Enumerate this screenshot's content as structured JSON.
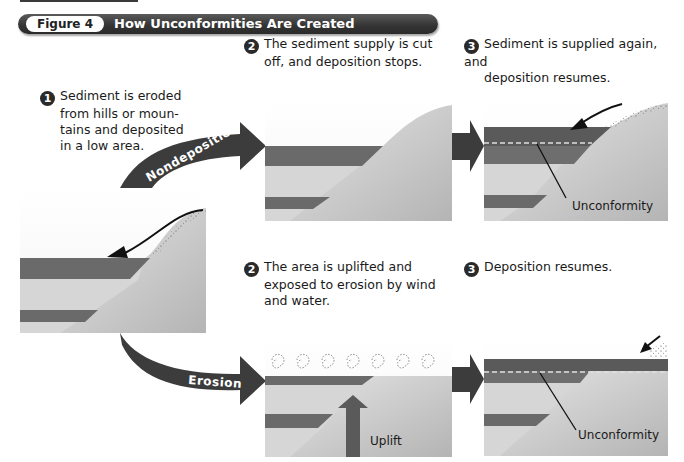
{
  "figure": {
    "label": "Figure 4",
    "title": "How Unconformities Are Created"
  },
  "steps": {
    "step1": {
      "number": "1",
      "text_lines": [
        "Sediment is eroded",
        "from hills or moun-",
        "tains and deposited",
        "in a low area."
      ]
    },
    "top": {
      "step2": {
        "number": "2",
        "text_lines": [
          "The sediment supply is cut",
          "off, and deposition stops."
        ]
      },
      "step3": {
        "number": "3",
        "text_lines": [
          "Sediment is supplied again, and",
          "deposition resumes."
        ]
      }
    },
    "bottom": {
      "step2": {
        "number": "2",
        "text_lines": [
          "The area is uplifted and",
          "exposed to erosion by wind",
          "and water."
        ]
      },
      "step3": {
        "number": "3",
        "text_lines": [
          "Deposition resumes."
        ]
      }
    }
  },
  "arrows": {
    "nondeposition": "Nondeposition",
    "erosion": "Erosion"
  },
  "labels": {
    "unconformity_top": "Unconformity",
    "unconformity_bottom": "Unconformity",
    "uplift": "Uplift"
  },
  "colors": {
    "dark_layer": "#6a6a6a",
    "light_layer": "#d4d4d4",
    "hill": "#c8c8c8",
    "panel_bg": "#f2f2f2",
    "arrow": "#3c3c3c",
    "header": "#333333"
  }
}
